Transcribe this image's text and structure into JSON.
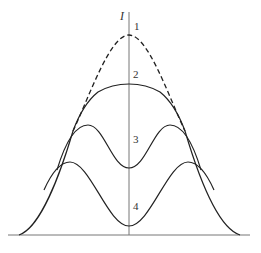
{
  "diagram": {
    "axis_label": "I",
    "curves": [
      {
        "id": "1",
        "label": "1",
        "style": "dashed",
        "description": "single peak, highest at center"
      },
      {
        "id": "2",
        "label": "2",
        "style": "solid",
        "description": "broad flat-top peak at center"
      },
      {
        "id": "3",
        "label": "3",
        "style": "solid",
        "description": "double peak with shallow central dip"
      },
      {
        "id": "4",
        "label": "4",
        "style": "solid",
        "description": "double peak with deep central dip"
      }
    ],
    "colors": {
      "line": "#222222",
      "axis": "#555555",
      "background": "#ffffff"
    }
  }
}
